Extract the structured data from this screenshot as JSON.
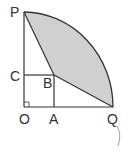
{
  "diagram": {
    "type": "geometry-quarter-circle",
    "labels": {
      "P": "P",
      "C": "C",
      "B": "B",
      "O": "O",
      "A": "A",
      "Q": "Q"
    },
    "colors": {
      "line": "#333333",
      "shade": "#d0d0d0",
      "background": "#ffffff"
    },
    "right_angle_marker_at": "O",
    "shaded_region": "P-B-Q bounded by arc PQ"
  }
}
